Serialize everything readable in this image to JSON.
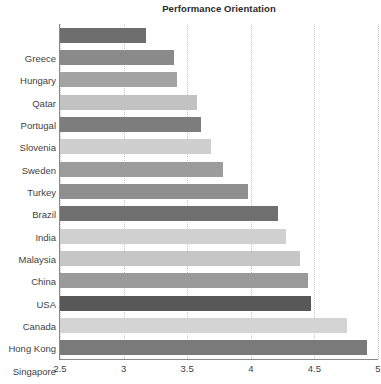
{
  "chart_data": {
    "type": "bar",
    "orientation": "horizontal",
    "title": "Performance Orientation",
    "xlabel": "",
    "ylabel": "",
    "xlim": [
      2.5,
      5
    ],
    "xticks": [
      2.5,
      3,
      3.5,
      4,
      4.5,
      5
    ],
    "xtick_labels": [
      "2.5",
      "3",
      "3.5",
      "4",
      "4.5",
      "5"
    ],
    "grid": "vertical-dotted",
    "legend": "none",
    "categories": [
      "Greece",
      "Hungary",
      "Qatar",
      "Portugal",
      "Slovenia",
      "Sweden",
      "Turkey",
      "Brazil",
      "India",
      "Malaysia",
      "China",
      "USA",
      "Canada",
      "Hong Kong",
      "Singapore"
    ],
    "values": [
      3.18,
      3.4,
      3.42,
      3.58,
      3.61,
      3.69,
      3.78,
      3.98,
      4.21,
      4.28,
      4.39,
      4.45,
      4.47,
      4.76,
      4.91
    ],
    "bar_colors": [
      "#6e6e6e",
      "#8a8a8a",
      "#a3a3a3",
      "#c2c2c2",
      "#7d7d7d",
      "#cfcfcf",
      "#9c9c9c",
      "#8f8f8f",
      "#6f6f6f",
      "#d0d0d0",
      "#c6c6c6",
      "#9a9a9a",
      "#585858",
      "#d4d4d4",
      "#7a7a7a"
    ]
  },
  "colors": {
    "background": "#ffffff",
    "axis": "#8a8a8a",
    "gridline": "#c8c8c8",
    "text": "#3f3f3f",
    "title": "#2b2b2b"
  }
}
